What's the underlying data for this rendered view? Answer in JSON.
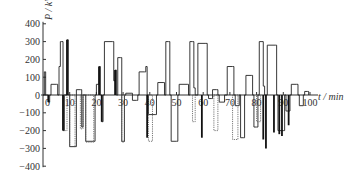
{
  "chart_data": {
    "type": "line",
    "subtype": "step",
    "title": "",
    "xlabel": "t / min",
    "ylabel": "P / kW",
    "xlim": [
      0,
      100
    ],
    "ylim": [
      -400,
      400
    ],
    "x_ticks": [
      0,
      10,
      20,
      30,
      40,
      50,
      60,
      70,
      80,
      90,
      100
    ],
    "x_tick_labels": [
      "0",
      "10",
      "20",
      "30",
      "40",
      "50",
      "60",
      "70",
      "80",
      "90",
      "100"
    ],
    "y_ticks": [
      400,
      300,
      200,
      100,
      0,
      -100,
      -200,
      -300,
      -400
    ],
    "y_tick_labels": [
      "400",
      "300",
      "200",
      "100",
      "0",
      "-100",
      "-200",
      "-300",
      "-400"
    ],
    "grid": false,
    "legend": null,
    "series": [
      {
        "name": "Power (step profile)",
        "style": "solid",
        "color": "#222222",
        "points": [
          [
            0,
            0
          ],
          [
            0.5,
            130
          ],
          [
            1,
            0
          ],
          [
            2,
            -40
          ],
          [
            2.5,
            0
          ],
          [
            3,
            60
          ],
          [
            5,
            60
          ],
          [
            5.5,
            0
          ],
          [
            6,
            160
          ],
          [
            6.5,
            300
          ],
          [
            7,
            300
          ],
          [
            7.5,
            -200
          ],
          [
            8,
            0
          ],
          [
            9,
            310
          ],
          [
            9.5,
            0
          ],
          [
            10,
            -290
          ],
          [
            12,
            -290
          ],
          [
            12.5,
            30
          ],
          [
            14,
            30
          ],
          [
            14.5,
            -180
          ],
          [
            15,
            0
          ],
          [
            16,
            -260
          ],
          [
            19,
            -260
          ],
          [
            19.5,
            0
          ],
          [
            20,
            60
          ],
          [
            21,
            160
          ],
          [
            21.5,
            0
          ],
          [
            22,
            -150
          ],
          [
            22.5,
            0
          ],
          [
            23,
            300
          ],
          [
            26,
            300
          ],
          [
            26.5,
            80
          ],
          [
            27,
            140
          ],
          [
            27.5,
            0
          ],
          [
            28,
            210
          ],
          [
            29,
            210
          ],
          [
            29.5,
            -260
          ],
          [
            30,
            -260
          ],
          [
            30.5,
            0
          ],
          [
            31,
            10
          ],
          [
            33,
            10
          ],
          [
            33.5,
            -30
          ],
          [
            35,
            -30
          ],
          [
            35.5,
            0
          ],
          [
            36,
            130
          ],
          [
            38,
            130
          ],
          [
            38.5,
            160
          ],
          [
            39,
            0
          ],
          [
            39.5,
            -110
          ],
          [
            42,
            -110
          ],
          [
            42.5,
            0
          ],
          [
            43,
            70
          ],
          [
            45,
            70
          ],
          [
            45.5,
            0
          ],
          [
            46,
            300
          ],
          [
            47,
            300
          ],
          [
            47.5,
            0
          ],
          [
            48,
            -260
          ],
          [
            50,
            -260
          ],
          [
            50.5,
            0
          ]
        ]
      },
      {
        "name": "Power (step profile, segment 2)",
        "style": "solid",
        "color": "#222222",
        "points": [
          [
            50.5,
            0
          ],
          [
            51,
            60
          ],
          [
            54,
            60
          ],
          [
            54.5,
            0
          ],
          [
            55,
            300
          ],
          [
            56,
            300
          ],
          [
            56.5,
            40
          ],
          [
            57,
            0
          ],
          [
            58,
            290
          ],
          [
            61,
            290
          ],
          [
            61.5,
            0
          ],
          [
            62,
            -20
          ],
          [
            63,
            -20
          ],
          [
            63.5,
            30
          ],
          [
            65,
            30
          ],
          [
            65.5,
            0
          ],
          [
            66,
            -40
          ],
          [
            68,
            0
          ],
          [
            69,
            160
          ],
          [
            71,
            160
          ],
          [
            71.5,
            0
          ],
          [
            72,
            -60
          ],
          [
            73,
            -60
          ],
          [
            73.5,
            0
          ],
          [
            74,
            -240
          ],
          [
            75,
            -240
          ],
          [
            75.5,
            0
          ],
          [
            76,
            110
          ],
          [
            78,
            110
          ],
          [
            78.5,
            0
          ],
          [
            79,
            -180
          ],
          [
            80,
            -180
          ],
          [
            80.5,
            0
          ],
          [
            81,
            300
          ],
          [
            82,
            300
          ],
          [
            82.5,
            50
          ],
          [
            83,
            0
          ],
          [
            84,
            280
          ],
          [
            87,
            280
          ],
          [
            87.5,
            0
          ],
          [
            88,
            -200
          ],
          [
            90,
            -200
          ],
          [
            90.5,
            0
          ],
          [
            91,
            -90
          ],
          [
            92,
            -90
          ],
          [
            92.5,
            0
          ],
          [
            93,
            60
          ],
          [
            95,
            60
          ],
          [
            95.5,
            0
          ],
          [
            96,
            -60
          ],
          [
            97,
            -60
          ],
          [
            97.5,
            0
          ],
          [
            98,
            20
          ],
          [
            99,
            20
          ],
          [
            99.5,
            0
          ]
        ]
      }
    ],
    "bars_dark": [
      {
        "x": 2,
        "y0": 0,
        "y1": -40
      },
      {
        "x": 7.5,
        "y0": 0,
        "y1": -200
      },
      {
        "x": 9,
        "y0": 0,
        "y1": 310
      },
      {
        "x": 21,
        "y0": 0,
        "y1": 160
      },
      {
        "x": 22,
        "y0": 0,
        "y1": -150
      },
      {
        "x": 27,
        "y0": 0,
        "y1": 140
      },
      {
        "x": 39,
        "y0": 0,
        "y1": -240
      },
      {
        "x": 59.5,
        "y0": 0,
        "y1": -240
      },
      {
        "x": 82.5,
        "y0": 0,
        "y1": -250
      },
      {
        "x": 83.5,
        "y0": 0,
        "y1": -300
      },
      {
        "x": 86.5,
        "y0": 0,
        "y1": -210
      },
      {
        "x": 88.5,
        "y0": 0,
        "y1": -220
      },
      {
        "x": 89.5,
        "y0": 0,
        "y1": -230
      },
      {
        "x": 92,
        "y0": 0,
        "y1": -170
      }
    ],
    "dotted_bars": [
      {
        "x0": 8,
        "x1": 9,
        "y": -200
      },
      {
        "x0": 10,
        "x1": 12,
        "y": -290
      },
      {
        "x0": 14,
        "x1": 15,
        "y": -190
      },
      {
        "x0": 16,
        "x1": 19,
        "y": -265
      },
      {
        "x0": 29.5,
        "x1": 30.5,
        "y": -265
      },
      {
        "x0": 39.5,
        "x1": 41,
        "y": -260
      },
      {
        "x0": 56,
        "x1": 57,
        "y": -150
      },
      {
        "x0": 64,
        "x1": 65.5,
        "y": -200
      },
      {
        "x0": 71,
        "x1": 73,
        "y": -250
      },
      {
        "x0": 80,
        "x1": 81.5,
        "y": -150
      }
    ]
  },
  "axis": {
    "y_title": "P / kW",
    "x_title": "t / min"
  },
  "colors": {
    "line": "#222222",
    "axis": "#333333",
    "background": "#ffffff"
  }
}
